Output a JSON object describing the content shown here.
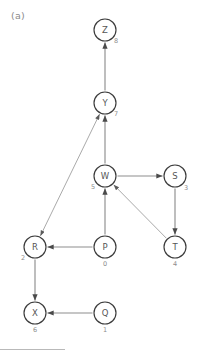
{
  "figure": {
    "panel_label": "(a)",
    "type": "directed-graph",
    "width": 205,
    "height": 357,
    "colors": {
      "background": "#ffffff",
      "node_fill": "#ffffff",
      "node_stroke": "#3b3b3b",
      "node_letter": "#555555",
      "node_index": "#8d8d8d",
      "edge": "#8e8e8e",
      "panel_label": "#8a8a8a",
      "footer_rule": "#b9b9b9"
    }
  },
  "nodes": [
    {
      "id": "Z",
      "label": "Z",
      "index": "8",
      "cx": 105,
      "cy": 30,
      "r": 11,
      "index_dx": 11,
      "index_dy": 11
    },
    {
      "id": "Y",
      "label": "Y",
      "index": "7",
      "cx": 105,
      "cy": 103,
      "r": 11,
      "index_dx": 11,
      "index_dy": 11
    },
    {
      "id": "W",
      "label": "W",
      "index": "5",
      "cx": 105,
      "cy": 176,
      "r": 11,
      "index_dx": -12,
      "index_dy": 11
    },
    {
      "id": "S",
      "label": "S",
      "index": "3",
      "cx": 175,
      "cy": 176,
      "r": 11,
      "index_dx": 11,
      "index_dy": 12
    },
    {
      "id": "T",
      "label": "T",
      "index": "4",
      "cx": 175,
      "cy": 247,
      "r": 11,
      "index_dx": 0,
      "index_dy": 17
    },
    {
      "id": "R",
      "label": "R",
      "index": "2",
      "cx": 35,
      "cy": 247,
      "r": 11,
      "index_dx": -12,
      "index_dy": 11
    },
    {
      "id": "P",
      "label": "P",
      "index": "0",
      "cx": 105,
      "cy": 247,
      "r": 11,
      "index_dx": 0,
      "index_dy": 17
    },
    {
      "id": "X",
      "label": "X",
      "index": "6",
      "cx": 35,
      "cy": 313,
      "r": 11,
      "index_dx": 0,
      "index_dy": 17
    },
    {
      "id": "Q",
      "label": "Q",
      "index": "1",
      "cx": 105,
      "cy": 313,
      "r": 11,
      "index_dx": 0,
      "index_dy": 17
    }
  ],
  "edges": [
    {
      "from": "Y",
      "to": "Z",
      "arrow": "forward",
      "style": "thick"
    },
    {
      "from": "W",
      "to": "Y",
      "arrow": "forward",
      "style": "thick"
    },
    {
      "from": "Y",
      "to": "R",
      "arrow": "bidirectional",
      "style": "thin"
    },
    {
      "from": "W",
      "to": "S",
      "arrow": "forward",
      "style": "thick"
    },
    {
      "from": "S",
      "to": "T",
      "arrow": "forward",
      "style": "thick"
    },
    {
      "from": "T",
      "to": "W",
      "arrow": "forward",
      "style": "thin"
    },
    {
      "from": "P",
      "to": "W",
      "arrow": "forward",
      "style": "thick"
    },
    {
      "from": "P",
      "to": "R",
      "arrow": "forward",
      "style": "thick"
    },
    {
      "from": "R",
      "to": "X",
      "arrow": "forward",
      "style": "thick"
    },
    {
      "from": "Q",
      "to": "X",
      "arrow": "forward",
      "style": "thick"
    }
  ],
  "footer": {
    "rule_visible": true
  }
}
